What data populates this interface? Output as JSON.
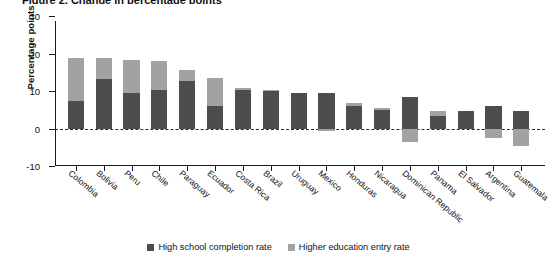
{
  "title_clipped": "Figure 2. Change in percentage points",
  "legend": {
    "position": "bottom-center",
    "items": [
      {
        "label": "High school completion rate",
        "color": "#4d4d4d",
        "swatch": "dark-square-swatch"
      },
      {
        "label": "Higher education entry rate",
        "color": "#a2a2a2",
        "swatch": "light-square-swatch"
      }
    ]
  },
  "axis": {
    "ylabel": "Percentage points",
    "yticks": [
      "30",
      "20",
      "10",
      "0",
      "-10"
    ],
    "ytick_values": [
      30,
      20,
      10,
      0,
      -10
    ],
    "ylim": [
      -10,
      30
    ],
    "zero_line": "dashed"
  },
  "chart_data": {
    "type": "bar",
    "subtype": "stacked-with-negatives",
    "title": "Change in percentage points",
    "xlabel": "",
    "ylabel": "Percentage points",
    "ylim": [
      -10,
      30
    ],
    "grid": false,
    "legend_position": "bottom-center",
    "categories": [
      "Colombia",
      "Bolivia",
      "Peru",
      "Chile",
      "Paraguay",
      "Ecuador",
      "Costa Rica",
      "Brazil",
      "Uruguay",
      "Mexico",
      "Honduras",
      "Nicaragua",
      "Dominican Republic",
      "Panama",
      "El Salvador",
      "Argentina",
      "Guatemala"
    ],
    "series": [
      {
        "name": "High school completion rate",
        "color": "#4d4d4d",
        "values": [
          7.4,
          13.2,
          9.4,
          10.4,
          12.7,
          6.1,
          10.3,
          9.9,
          9.6,
          9.4,
          6.1,
          5.0,
          8.4,
          3.4,
          4.6,
          6.0,
          4.6
        ]
      },
      {
        "name": "Higher education entry rate",
        "color": "#a2a2a2",
        "values": [
          11.4,
          5.6,
          8.9,
          7.5,
          2.9,
          7.5,
          0.4,
          0.4,
          0.0,
          -0.6,
          0.6,
          0.5,
          -3.6,
          1.4,
          0.0,
          -2.4,
          -4.6
        ]
      }
    ],
    "totals_positive": [
      18.8,
      18.8,
      18.3,
      17.9,
      15.6,
      13.6,
      10.7,
      10.3,
      9.6,
      9.4,
      6.7,
      5.5,
      8.4,
      4.8,
      4.6,
      6.0,
      4.6
    ]
  }
}
